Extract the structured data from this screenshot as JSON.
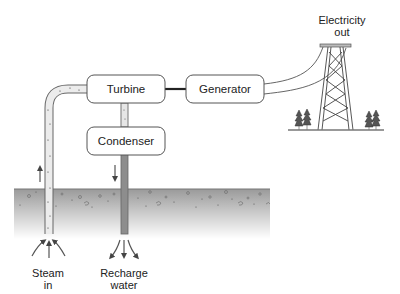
{
  "diagram": {
    "type": "geothermal-power-plant",
    "components": {
      "turbine": "Turbine",
      "generator": "Generator",
      "condenser": "Condenser"
    },
    "labels": {
      "electricity_line1": "Electricity",
      "electricity_line2": "out",
      "steam_line1": "Steam",
      "steam_line2": "in",
      "recharge_line1": "Recharge",
      "recharge_line2": "water"
    },
    "colors": {
      "box_fill": "#ffffff",
      "box_stroke": "#555555",
      "pipe_fill": "#e8e8e8",
      "recharge_pipe": "#8a8a8a",
      "ground_top": "#9a9a9a",
      "ground_bottom": "#ffffff",
      "shaft": "#222222"
    }
  }
}
